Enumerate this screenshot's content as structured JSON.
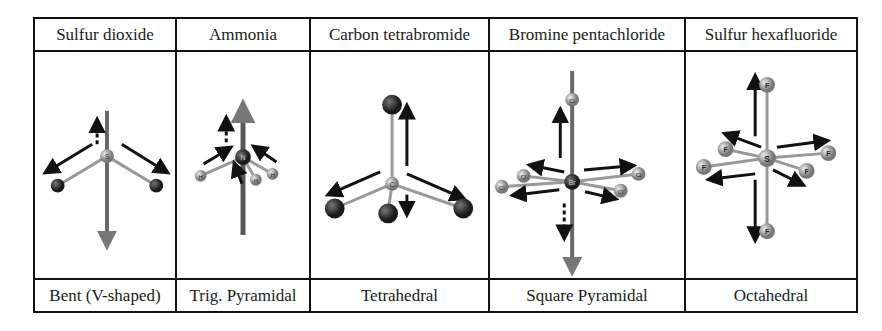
{
  "table": {
    "columns": [
      {
        "name": "Sulfur dioxide",
        "geometry": "Bent (V-shaped)",
        "central_atom": "S",
        "ligand": "O",
        "ligand_count": 2
      },
      {
        "name": "Ammonia",
        "geometry": "Trig. Pyramidal",
        "central_atom": "N",
        "ligand": "H",
        "ligand_count": 3
      },
      {
        "name": "Carbon tetrabromide",
        "geometry": "Tetrahedral",
        "central_atom": "C",
        "ligand": "Br",
        "ligand_count": 4
      },
      {
        "name": "Bromine pentachloride",
        "geometry": "Square Pyramidal",
        "central_atom": "Br",
        "ligand": "Cl",
        "ligand_count": 5
      },
      {
        "name": "Sulfur hexafluoride",
        "geometry": "Octahedral",
        "central_atom": "S",
        "ligand": "F",
        "ligand_count": 6
      }
    ]
  },
  "colors": {
    "border": "#111111",
    "bond": "#8a8a8a",
    "arrow": "#111111",
    "net_dipole": "#555555",
    "dark_atom": "#2a2a2a",
    "light_atom": "#b0b0b0"
  }
}
